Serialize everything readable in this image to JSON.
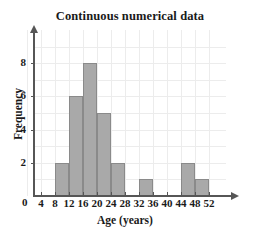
{
  "chart_data": {
    "type": "bar",
    "title": "Continuous numerical data",
    "xlabel": "Age (years)",
    "ylabel": "Frequency",
    "grid": true,
    "legend": "none",
    "xlim": [
      0,
      52
    ],
    "ylim": [
      0,
      9
    ],
    "bin_width": 4,
    "x_ticks": [
      "4",
      "8",
      "12",
      "16",
      "20",
      "24",
      "28",
      "32",
      "36",
      "40",
      "44",
      "48",
      "52"
    ],
    "y_ticks": [
      "0",
      "2",
      "4",
      "6",
      "8"
    ],
    "origin_label": "0",
    "bins": [
      {
        "start": 0,
        "end": 4,
        "value": 0
      },
      {
        "start": 4,
        "end": 8,
        "value": 0
      },
      {
        "start": 8,
        "end": 12,
        "value": 2
      },
      {
        "start": 12,
        "end": 16,
        "value": 6
      },
      {
        "start": 16,
        "end": 20,
        "value": 8
      },
      {
        "start": 20,
        "end": 24,
        "value": 5
      },
      {
        "start": 24,
        "end": 28,
        "value": 2
      },
      {
        "start": 28,
        "end": 32,
        "value": 0
      },
      {
        "start": 32,
        "end": 36,
        "value": 1
      },
      {
        "start": 36,
        "end": 40,
        "value": 0
      },
      {
        "start": 40,
        "end": 44,
        "value": 0
      },
      {
        "start": 44,
        "end": 48,
        "value": 2
      },
      {
        "start": 48,
        "end": 52,
        "value": 1
      }
    ],
    "categories": [
      "0-4",
      "4-8",
      "8-12",
      "12-16",
      "16-20",
      "20-24",
      "24-28",
      "28-32",
      "32-36",
      "36-40",
      "40-44",
      "44-48",
      "48-52"
    ],
    "values": [
      0,
      0,
      2,
      6,
      8,
      5,
      2,
      0,
      1,
      0,
      0,
      2,
      1
    ],
    "colors": {
      "bar_fill": "#a9a9a9",
      "bar_stroke": "#8a8a8a",
      "axis": "#565656",
      "grid": "#ececec",
      "text": "#1a1a1a",
      "background": "#ffffff"
    }
  }
}
